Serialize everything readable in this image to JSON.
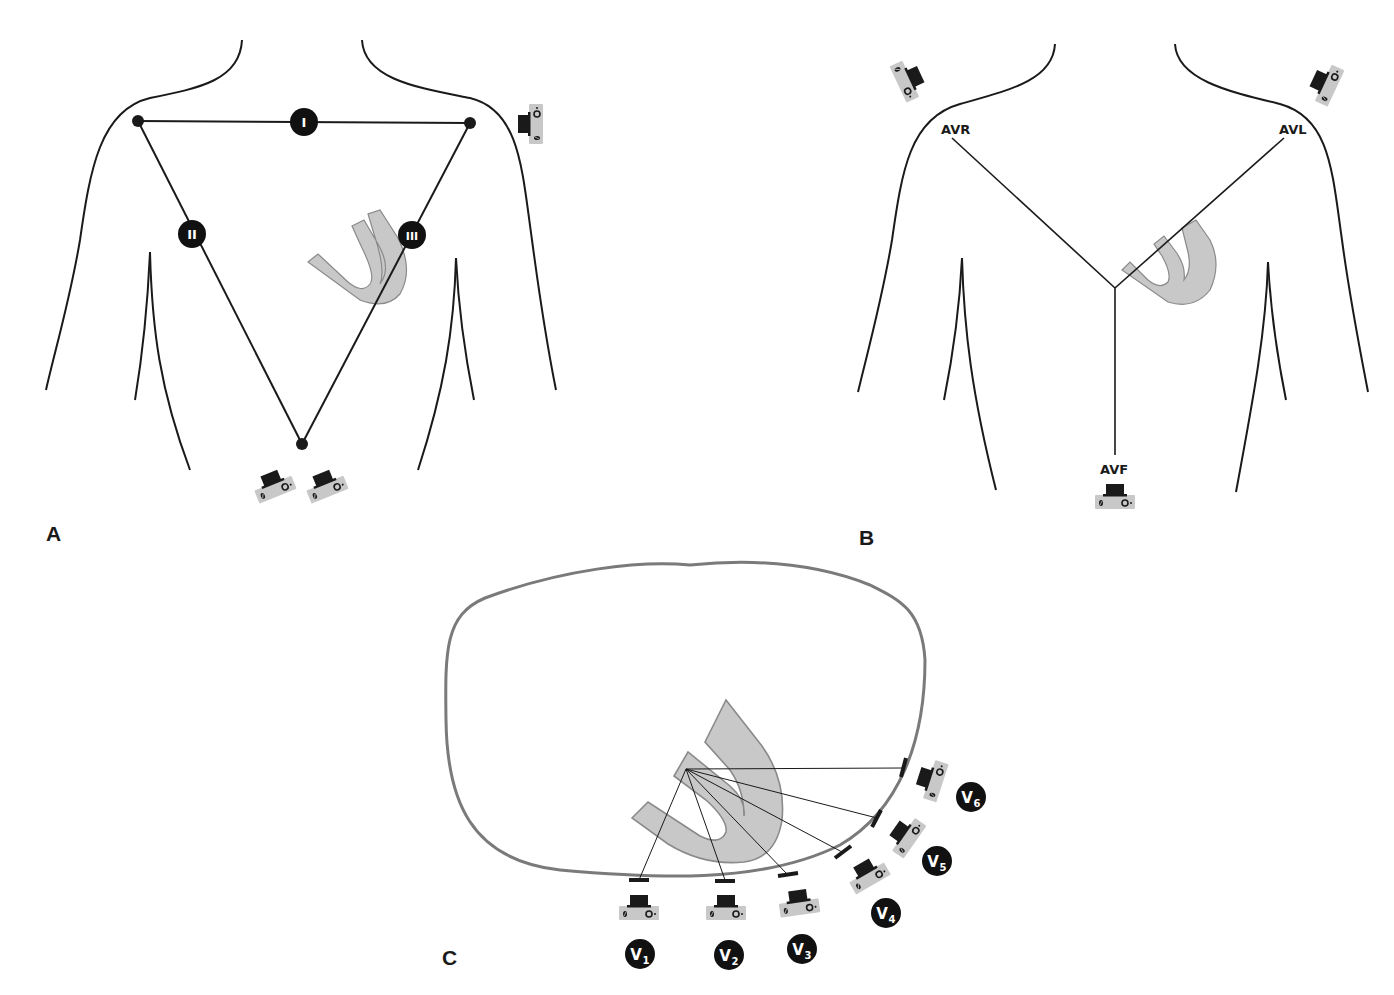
{
  "figure": {
    "colors": {
      "outline": "#1a1a1a",
      "heart_fill": "#c8c8c8",
      "heart_stroke": "#8a8a8a",
      "thorax_stroke": "#7a7a7a",
      "camera_body": "#c8c8c8",
      "camera_lens": "#1a1a1a",
      "badge": "#111111"
    }
  },
  "panels": {
    "a": {
      "label": "A",
      "description": "Einthoven triangle - bipolar limb leads",
      "leads": [
        {
          "id": "I",
          "label": "I"
        },
        {
          "id": "II",
          "label": "II"
        },
        {
          "id": "III",
          "label": "III"
        }
      ]
    },
    "b": {
      "label": "B",
      "description": "Augmented unipolar limb leads",
      "leads": [
        {
          "id": "AVR",
          "label": "AVR"
        },
        {
          "id": "AVL",
          "label": "AVL"
        },
        {
          "id": "AVF",
          "label": "AVF"
        }
      ]
    },
    "c": {
      "label": "C",
      "description": "Precordial chest leads (transverse section)",
      "leads": [
        {
          "id": "V1",
          "letter": "V",
          "sub": "1"
        },
        {
          "id": "V2",
          "letter": "V",
          "sub": "2"
        },
        {
          "id": "V3",
          "letter": "V",
          "sub": "3"
        },
        {
          "id": "V4",
          "letter": "V",
          "sub": "4"
        },
        {
          "id": "V5",
          "letter": "V",
          "sub": "5"
        },
        {
          "id": "V6",
          "letter": "V",
          "sub": "6"
        }
      ]
    }
  }
}
